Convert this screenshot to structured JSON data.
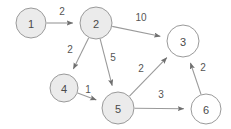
{
  "diagram": {
    "type": "directed-weighted-graph",
    "colors": {
      "node_fill_shaded": "#ebebeb",
      "node_fill_plain": "#ffffff",
      "node_stroke": "#9a9a9a",
      "edge_stroke": "#9a9a9a",
      "label_text": "#4a4a4a",
      "weight_text": "#555555",
      "background": "#ffffff"
    },
    "nodes": [
      {
        "id": "1",
        "label": "1",
        "cx": 31,
        "cy": 23,
        "r": 15,
        "fill": "#ebebeb"
      },
      {
        "id": "2",
        "label": "2",
        "cx": 96,
        "cy": 23,
        "r": 16,
        "fill": "#ebebeb"
      },
      {
        "id": "3",
        "label": "3",
        "cx": 183,
        "cy": 41,
        "r": 16,
        "fill": "#ffffff"
      },
      {
        "id": "4",
        "label": "4",
        "cx": 64,
        "cy": 88,
        "r": 14,
        "fill": "#ebebeb"
      },
      {
        "id": "5",
        "label": "5",
        "cx": 118,
        "cy": 108,
        "r": 16,
        "fill": "#ebebeb"
      },
      {
        "id": "6",
        "label": "6",
        "cx": 206,
        "cy": 109,
        "r": 15,
        "fill": "#ffffff"
      }
    ],
    "edges": [
      {
        "id": "e1",
        "from": "1",
        "to": "2",
        "weight": "2",
        "lx": 62,
        "ly": 11
      },
      {
        "id": "e2",
        "from": "2",
        "to": "3",
        "weight": "10",
        "lx": 141,
        "ly": 17
      },
      {
        "id": "e3",
        "from": "2",
        "to": "4",
        "weight": "2",
        "lx": 70,
        "ly": 49
      },
      {
        "id": "e4",
        "from": "2",
        "to": "5",
        "weight": "5",
        "lx": 113,
        "ly": 57
      },
      {
        "id": "e5",
        "from": "4",
        "to": "5",
        "weight": "1",
        "lx": 88,
        "ly": 89
      },
      {
        "id": "e6",
        "from": "5",
        "to": "3",
        "weight": "2",
        "lx": 141,
        "ly": 68
      },
      {
        "id": "e7",
        "from": "5",
        "to": "6",
        "weight": "3",
        "lx": 161,
        "ly": 94
      },
      {
        "id": "e8",
        "from": "6",
        "to": "3",
        "weight": "2",
        "lx": 203,
        "ly": 67
      }
    ]
  }
}
